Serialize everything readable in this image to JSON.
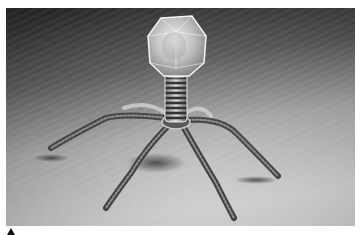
{
  "image": {
    "subject": "bacteriophage 3D render",
    "description": "Grayscale rendering of a bacteriophage virus with icosahedral capsid head, ribbed helical tail sheath, and six thin tail fibers standing on a textured surface",
    "colors": {
      "background_top": "#3a3a3a",
      "background_bottom": "#c8c8c8",
      "capsid": "#d8d8d8",
      "tail_dark": "#3c3c3c",
      "fiber": "#5a5a5a",
      "page_bg": "#ffffff",
      "marker": "#111111"
    }
  },
  "marker": {
    "icon": "triangle-up-icon"
  }
}
